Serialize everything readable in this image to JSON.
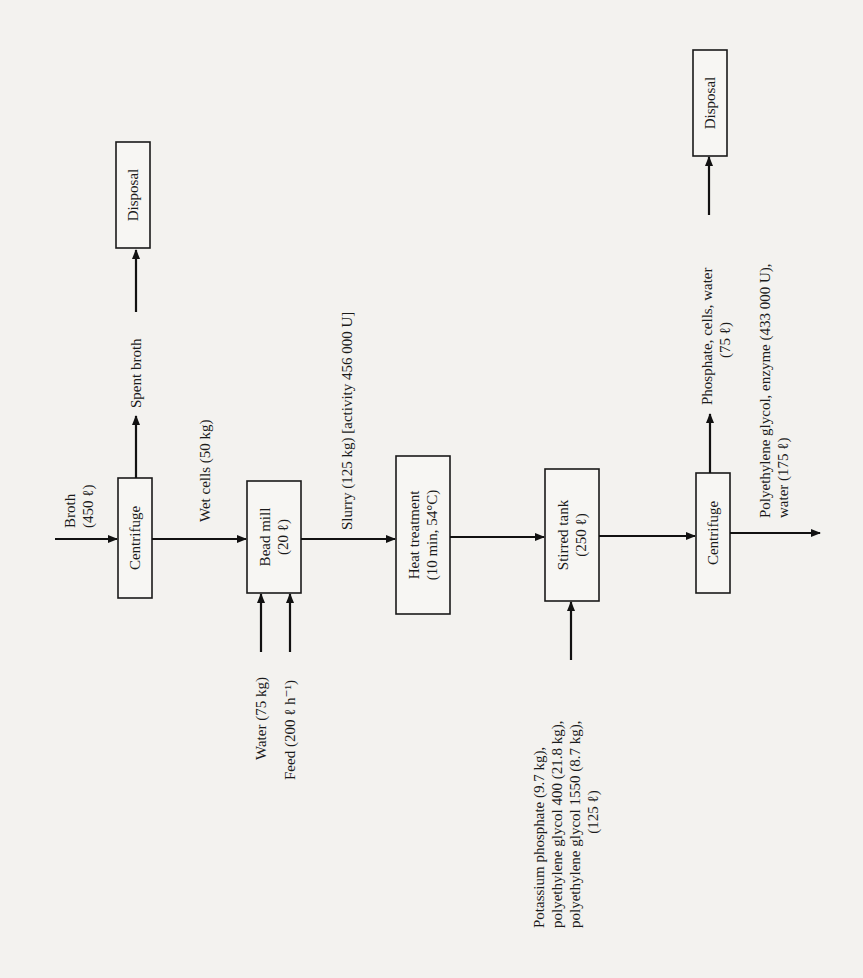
{
  "diagram": {
    "type": "process-flow",
    "orientation": "rotated-90-ccw",
    "units": [
      {
        "id": "centrifuge_1",
        "label": "Centrifuge"
      },
      {
        "id": "disposal_1",
        "label": "Disposal"
      },
      {
        "id": "bead_mill",
        "label": "Bead mill",
        "sub": "(20 ℓ)"
      },
      {
        "id": "heat_treatment",
        "label": "Heat treatment",
        "sub": "(10 min, 54°C)"
      },
      {
        "id": "stirred_tank",
        "label": "Stirred tank",
        "sub": "(250 ℓ)"
      },
      {
        "id": "centrifuge_2",
        "label": "Centrifuge"
      },
      {
        "id": "disposal_2",
        "label": "Disposal"
      }
    ],
    "streams": {
      "broth": {
        "line1": "Broth",
        "line2": "(450 ℓ)"
      },
      "spent_broth": {
        "label": "Spent broth"
      },
      "wet_cells": {
        "label": "Wet cells (50 kg)"
      },
      "water": {
        "label": "Water (75 kg)"
      },
      "feed": {
        "label": "Feed (200 ℓ h⁻¹)"
      },
      "slurry": {
        "label": "Slurry (125 kg) [activity 456 000 U]"
      },
      "reagents": {
        "line1": "Potassium phosphate (9.7 kg),",
        "line2": "polyethylene glycol 400 (21.8 kg),",
        "line3": "polyethylene glycol 1550 (8.7 kg),",
        "line4": "(125 ℓ)"
      },
      "waste_2": {
        "line1": "Phosphate, cells, water",
        "line2": "(75 ℓ)"
      },
      "product": {
        "line1": "Polyethylene glycol, enzyme (433 000 U),",
        "line2": "water (175 ℓ)"
      }
    },
    "connections": [
      {
        "from": "broth",
        "to": "centrifuge_1"
      },
      {
        "from": "centrifuge_1",
        "to": "disposal_1",
        "stream": "spent_broth"
      },
      {
        "from": "centrifuge_1",
        "to": "bead_mill",
        "stream": "wet_cells"
      },
      {
        "from": "water",
        "to": "bead_mill"
      },
      {
        "from": "feed",
        "to": "bead_mill"
      },
      {
        "from": "bead_mill",
        "to": "heat_treatment",
        "stream": "slurry"
      },
      {
        "from": "heat_treatment",
        "to": "stirred_tank"
      },
      {
        "from": "reagents",
        "to": "stirred_tank"
      },
      {
        "from": "stirred_tank",
        "to": "centrifuge_2"
      },
      {
        "from": "centrifuge_2",
        "to": "disposal_2",
        "stream": "waste_2"
      },
      {
        "from": "centrifuge_2",
        "to": "product",
        "stream": "product"
      }
    ]
  }
}
